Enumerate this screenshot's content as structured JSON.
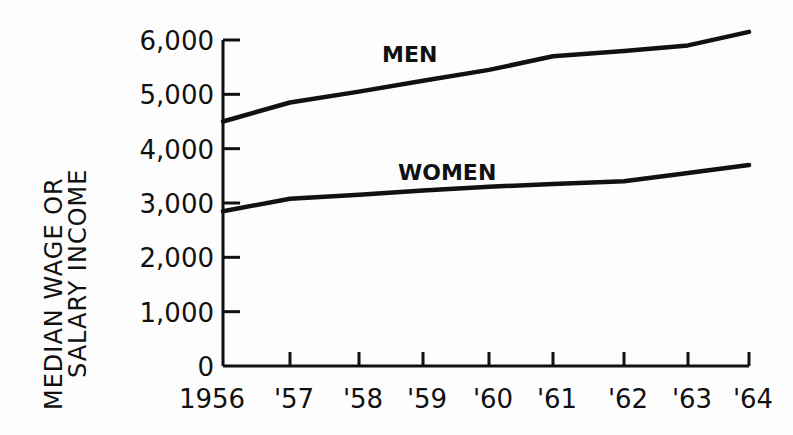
{
  "chart_data": {
    "type": "line",
    "title": "",
    "xlabel": "",
    "ylabel": "MEDIAN WAGE OR SALARY INCOME",
    "ylabel_lines": [
      "MEDIAN WAGE OR",
      "SALARY INCOME"
    ],
    "categories": [
      "1956",
      "'57",
      "'58",
      "'59",
      "'60",
      "'61",
      "'62",
      "'63",
      "'64"
    ],
    "y_ticks": [
      "0",
      "1,000",
      "2,000",
      "3,000",
      "4,000",
      "5,000",
      "6,000"
    ],
    "ylim": [
      0,
      6000
    ],
    "grid": false,
    "legend": "inline labels",
    "series": [
      {
        "name": "MEN",
        "values": [
          4500,
          4850,
          5050,
          5250,
          5450,
          5700,
          5800,
          5900,
          6150
        ]
      },
      {
        "name": "WOMEN",
        "values": [
          2850,
          3080,
          3150,
          3230,
          3300,
          3350,
          3400,
          3550,
          3700
        ]
      }
    ]
  }
}
